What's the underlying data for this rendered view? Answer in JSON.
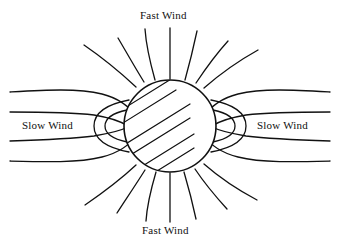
{
  "figure": {
    "background_color": "#ffffff",
    "stroke_color": "#111111",
    "width": 340,
    "height": 248
  },
  "labels": {
    "fast_wind_top": "Fast Wind",
    "fast_wind_bottom": "Fast Wind",
    "slow_wind_left": "Slow Wind",
    "slow_wind_right": "Slow Wind"
  },
  "sun": {
    "name": "sun-disk",
    "center_x": 170,
    "center_y": 126,
    "radius": 47,
    "fill": "#ffffff",
    "hatch_angle_deg": -32,
    "hatch_count": 10
  },
  "diagram_data": {
    "type": "diagram",
    "subject": "solar wind",
    "elements": [
      {
        "name": "sun-disk",
        "kind": "hatched-circle"
      },
      {
        "name": "fast-wind-radial-lines-top",
        "kind": "radial-streamlines",
        "count": 7
      },
      {
        "name": "fast-wind-radial-lines-bottom",
        "kind": "radial-streamlines",
        "count": 7
      },
      {
        "name": "slow-wind-streamlines-left",
        "kind": "deflected-streamlines",
        "count": 4
      },
      {
        "name": "slow-wind-streamlines-right",
        "kind": "deflected-streamlines",
        "count": 4
      },
      {
        "name": "slow-wind-closed-loop-left",
        "kind": "closed-loop",
        "count": 2
      },
      {
        "name": "slow-wind-closed-loop-right",
        "kind": "closed-loop",
        "count": 2
      }
    ],
    "annotations": [
      "Fast Wind",
      "Fast Wind",
      "Slow Wind",
      "Slow Wind"
    ]
  }
}
